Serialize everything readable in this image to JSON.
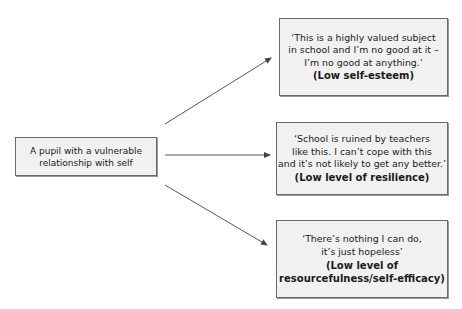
{
  "diagram": {
    "type": "concept-map",
    "source": {
      "text": "A pupil with a vulnerable\nrelationship with self"
    },
    "outcomes": [
      {
        "quote": "‘This is a highly valued subject\nin school and I’m no good at it –\nI’m no good at anything.’",
        "label": "(Low self-esteem)"
      },
      {
        "quote": "‘School is ruined by teachers\nlike this. I can’t cope with this\nand it’s not likely to get any better.’",
        "label": "(Low level of resilience)"
      },
      {
        "quote": "‘There’s nothing I can do,\nit’s just hopeless’",
        "label": "(Low level of\nresourcefulness/self-efficacy)"
      }
    ],
    "edges": [
      {
        "from": "source",
        "to": "outcome-0",
        "style": "arrow"
      },
      {
        "from": "source",
        "to": "outcome-1",
        "style": "arrow"
      },
      {
        "from": "source",
        "to": "outcome-2",
        "style": "arrow"
      }
    ],
    "colors": {
      "box_fill": "#f1f1f1",
      "box_border": "#6a6a6a",
      "arrow": "#444444"
    }
  }
}
